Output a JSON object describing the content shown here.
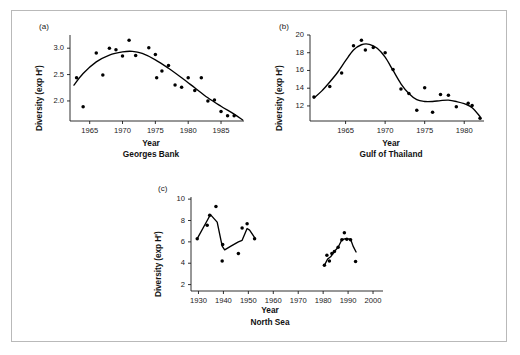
{
  "figure": {
    "border_color": "#b9b9b9",
    "background": "#ffffff",
    "axis_color": "#1a1a1a",
    "marker_color": "#000000"
  },
  "panels": [
    {
      "tag": "(a)",
      "caption": "Georges Bank",
      "xlabel": "Year",
      "ylabel": "Diversity (exp H')"
    },
    {
      "tag": "(b)",
      "caption": "Gulf of Thailand",
      "xlabel": "Year",
      "ylabel": "Diversity (exp H')"
    },
    {
      "tag": "(c)",
      "caption": "North Sea",
      "xlabel": "Year",
      "ylabel": "Diversity (exp H')"
    }
  ],
  "chart_data": [
    {
      "type": "scatter",
      "title": "Georges Bank",
      "panel": "(a)",
      "xlabel": "Year",
      "ylabel": "Diversity (exp H')",
      "xlim": [
        1962,
        1988.5
      ],
      "ylim": [
        1.62,
        3.25
      ],
      "xticks": [
        1965,
        1970,
        1975,
        1980,
        1985
      ],
      "xtick_labels": [
        "1965",
        "1970",
        "1975",
        "1980",
        "1985"
      ],
      "yticks": [
        2.0,
        2.5,
        3.0
      ],
      "ytick_labels": [
        "2.0",
        "2.5",
        "3.0"
      ],
      "grid": false,
      "legend": false,
      "points": [
        {
          "x": 1963,
          "y": 2.44
        },
        {
          "x": 1964,
          "y": 1.89
        },
        {
          "x": 1966,
          "y": 2.91
        },
        {
          "x": 1967,
          "y": 2.49
        },
        {
          "x": 1968,
          "y": 3.0
        },
        {
          "x": 1969,
          "y": 2.97
        },
        {
          "x": 1970,
          "y": 2.85
        },
        {
          "x": 1971,
          "y": 3.15
        },
        {
          "x": 1972,
          "y": 2.86
        },
        {
          "x": 1974,
          "y": 3.01
        },
        {
          "x": 1975,
          "y": 2.88
        },
        {
          "x": 1975.2,
          "y": 2.44
        },
        {
          "x": 1976,
          "y": 2.57
        },
        {
          "x": 1977,
          "y": 2.67
        },
        {
          "x": 1978,
          "y": 2.3
        },
        {
          "x": 1979,
          "y": 2.26
        },
        {
          "x": 1980,
          "y": 2.44
        },
        {
          "x": 1981,
          "y": 2.2
        },
        {
          "x": 1982,
          "y": 2.44
        },
        {
          "x": 1983,
          "y": 2.0
        },
        {
          "x": 1984,
          "y": 2.02
        },
        {
          "x": 1985,
          "y": 1.8
        },
        {
          "x": 1986,
          "y": 1.72
        },
        {
          "x": 1987,
          "y": 1.72
        }
      ],
      "trend": [
        {
          "x": 1962.6,
          "y": 2.3
        },
        {
          "x": 1964,
          "y": 2.52
        },
        {
          "x": 1966,
          "y": 2.74
        },
        {
          "x": 1968,
          "y": 2.87
        },
        {
          "x": 1970,
          "y": 2.93
        },
        {
          "x": 1971.5,
          "y": 2.94
        },
        {
          "x": 1973,
          "y": 2.9
        },
        {
          "x": 1975,
          "y": 2.78
        },
        {
          "x": 1977,
          "y": 2.62
        },
        {
          "x": 1979,
          "y": 2.44
        },
        {
          "x": 1981,
          "y": 2.25
        },
        {
          "x": 1983,
          "y": 2.06
        },
        {
          "x": 1985,
          "y": 1.9
        },
        {
          "x": 1987,
          "y": 1.75
        },
        {
          "x": 1988.3,
          "y": 1.64
        }
      ]
    },
    {
      "type": "scatter",
      "title": "Gulf of Thailand",
      "panel": "(b)",
      "xlabel": "Year",
      "ylabel": "Diversity (exp H')",
      "xlim": [
        1960.5,
        1982.5
      ],
      "ylim": [
        10.3,
        20.0
      ],
      "xticks": [
        1965,
        1970,
        1975,
        1980
      ],
      "xtick_labels": [
        "1965",
        "1970",
        "1975",
        "1980"
      ],
      "yticks": [
        12,
        14,
        16,
        18,
        20
      ],
      "ytick_labels": [
        "12",
        "14",
        "16",
        "18",
        "20"
      ],
      "grid": false,
      "legend": false,
      "points": [
        {
          "x": 1961,
          "y": 13.0
        },
        {
          "x": 1963,
          "y": 14.2
        },
        {
          "x": 1964.5,
          "y": 15.7
        },
        {
          "x": 1966,
          "y": 18.8
        },
        {
          "x": 1967,
          "y": 19.4
        },
        {
          "x": 1967.5,
          "y": 18.3
        },
        {
          "x": 1968.5,
          "y": 18.6
        },
        {
          "x": 1970,
          "y": 18.0
        },
        {
          "x": 1971,
          "y": 16.1
        },
        {
          "x": 1972,
          "y": 13.9
        },
        {
          "x": 1973,
          "y": 13.4
        },
        {
          "x": 1974,
          "y": 11.5
        },
        {
          "x": 1975,
          "y": 14.05
        },
        {
          "x": 1976,
          "y": 11.3
        },
        {
          "x": 1977,
          "y": 13.3
        },
        {
          "x": 1978,
          "y": 13.2
        },
        {
          "x": 1979,
          "y": 11.9
        },
        {
          "x": 1980.5,
          "y": 12.3
        },
        {
          "x": 1981,
          "y": 12.05
        },
        {
          "x": 1982,
          "y": 10.6
        }
      ],
      "trend": [
        {
          "x": 1961,
          "y": 12.9
        },
        {
          "x": 1962,
          "y": 13.7
        },
        {
          "x": 1963,
          "y": 14.7
        },
        {
          "x": 1964,
          "y": 15.8
        },
        {
          "x": 1965,
          "y": 17.1
        },
        {
          "x": 1966,
          "y": 18.3
        },
        {
          "x": 1967,
          "y": 18.9
        },
        {
          "x": 1968,
          "y": 18.95
        },
        {
          "x": 1969,
          "y": 18.5
        },
        {
          "x": 1970,
          "y": 17.5
        },
        {
          "x": 1971,
          "y": 16.0
        },
        {
          "x": 1972,
          "y": 14.5
        },
        {
          "x": 1973,
          "y": 13.4
        },
        {
          "x": 1974,
          "y": 12.7
        },
        {
          "x": 1975,
          "y": 12.5
        },
        {
          "x": 1976,
          "y": 12.5
        },
        {
          "x": 1977,
          "y": 12.6
        },
        {
          "x": 1978,
          "y": 12.65
        },
        {
          "x": 1979,
          "y": 12.5
        },
        {
          "x": 1980,
          "y": 12.25
        },
        {
          "x": 1981,
          "y": 11.8
        },
        {
          "x": 1982,
          "y": 10.8
        }
      ]
    },
    {
      "type": "scatter",
      "title": "North Sea",
      "panel": "(c)",
      "xlabel": "Year",
      "ylabel": "Diversity (exp H')",
      "xlim": [
        1927,
        2004
      ],
      "ylim": [
        1.4,
        10.2
      ],
      "xticks": [
        1930,
        1940,
        1950,
        1960,
        1970,
        1980,
        1990,
        2000
      ],
      "xtick_labels": [
        "1930",
        "1940",
        "1950",
        "1960",
        "1970",
        "1980",
        "1990",
        "2000"
      ],
      "yticks": [
        2,
        4,
        6,
        8,
        10
      ],
      "ytick_labels": [
        "2",
        "4",
        "6",
        "8",
        "10"
      ],
      "grid": false,
      "legend": false,
      "points": [
        {
          "x": 1929.5,
          "y": 6.3
        },
        {
          "x": 1933.5,
          "y": 7.55
        },
        {
          "x": 1934.5,
          "y": 8.5
        },
        {
          "x": 1937,
          "y": 9.3
        },
        {
          "x": 1939.5,
          "y": 4.2
        },
        {
          "x": 1939.7,
          "y": 5.75
        },
        {
          "x": 1946,
          "y": 4.9
        },
        {
          "x": 1947.5,
          "y": 7.3
        },
        {
          "x": 1949.5,
          "y": 7.7
        },
        {
          "x": 1952.5,
          "y": 6.3
        },
        {
          "x": 1980.5,
          "y": 3.8
        },
        {
          "x": 1981.5,
          "y": 4.75
        },
        {
          "x": 1982.5,
          "y": 4.2
        },
        {
          "x": 1983.5,
          "y": 4.9
        },
        {
          "x": 1984.5,
          "y": 5.1
        },
        {
          "x": 1986,
          "y": 5.5
        },
        {
          "x": 1987.5,
          "y": 6.2
        },
        {
          "x": 1988.5,
          "y": 6.85
        },
        {
          "x": 1989.5,
          "y": 6.25
        },
        {
          "x": 1991,
          "y": 6.2
        },
        {
          "x": 1993,
          "y": 4.15
        }
      ],
      "trend_segments": [
        [
          {
            "x": 1929.5,
            "y": 6.3
          },
          {
            "x": 1933.5,
            "y": 8.0
          },
          {
            "x": 1934.8,
            "y": 8.55
          },
          {
            "x": 1937.5,
            "y": 7.85
          },
          {
            "x": 1939.5,
            "y": 5.6
          },
          {
            "x": 1940.5,
            "y": 5.25
          },
          {
            "x": 1943,
            "y": 5.6
          },
          {
            "x": 1946,
            "y": 6.0
          },
          {
            "x": 1947.5,
            "y": 6.15
          },
          {
            "x": 1949.5,
            "y": 7.25
          },
          {
            "x": 1950.5,
            "y": 7.1
          },
          {
            "x": 1952.8,
            "y": 6.3
          }
        ],
        [
          {
            "x": 1980.5,
            "y": 3.8
          },
          {
            "x": 1981.8,
            "y": 4.4
          },
          {
            "x": 1983,
            "y": 4.6
          },
          {
            "x": 1984.5,
            "y": 5.1
          },
          {
            "x": 1986,
            "y": 5.5
          },
          {
            "x": 1987.5,
            "y": 6.2
          },
          {
            "x": 1989,
            "y": 6.3
          },
          {
            "x": 1991,
            "y": 6.25
          },
          {
            "x": 1992,
            "y": 5.6
          },
          {
            "x": 1993.2,
            "y": 5.05
          }
        ]
      ]
    }
  ]
}
